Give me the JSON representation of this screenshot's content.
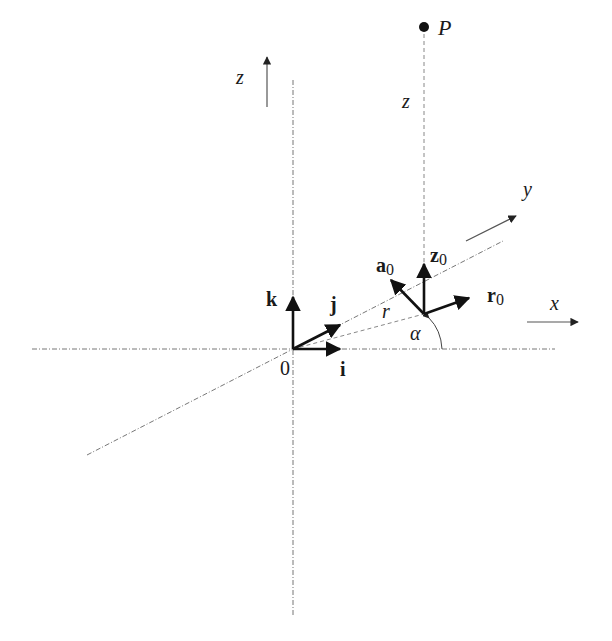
{
  "diagram": {
    "axes": {
      "z_label": "z",
      "x_label": "x",
      "y_label": "y",
      "origin_label": "0"
    },
    "point": {
      "label": "P",
      "height_label": "z"
    },
    "cartesian_unit_vectors": {
      "i": "i",
      "j": "j",
      "k": "k"
    },
    "cylindrical_unit_vectors": {
      "r0_base": "r",
      "a0_base": "a",
      "z0_base": "z",
      "subscript": "0"
    },
    "radius_label": "r",
    "angle_label": "α",
    "colors": {
      "ink": "#111111",
      "axis": "#777777",
      "background": "#ffffff"
    }
  }
}
